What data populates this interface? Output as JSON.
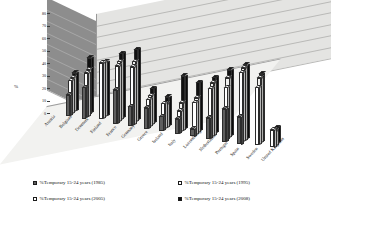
{
  "chart_data": {
    "type": "bar",
    "title": "",
    "xlabel": "",
    "ylabel": "%",
    "ylim": [
      0,
      80
    ],
    "yticks": [
      0,
      10,
      20,
      30,
      40,
      50,
      60,
      70,
      80
    ],
    "grid": true,
    "legend_position": "bottom",
    "categories": [
      "Austria",
      "Belgium",
      "Denmark",
      "Finland",
      "France",
      "Germany",
      "Greece",
      "Ireland",
      "Italy",
      "Luxembourg",
      "Netherlands",
      "Portugal",
      "Spain",
      "Sweden",
      "United Kingdom"
    ],
    "series": [
      {
        "name": "%Temporary 15-24 years (1985)",
        "color": "#5e5e5e",
        "marker": "filled-dark-square",
        "values": [
          0,
          17,
          25,
          0,
          27,
          16,
          17,
          12,
          12,
          6,
          17,
          26,
          22,
          0,
          0
        ]
      },
      {
        "name": "%Temporary 15-24 years (1995)",
        "color": "#ffffff",
        "marker": "hollow-square",
        "values": [
          0,
          27,
          35,
          45,
          45,
          46,
          22,
          21,
          17,
          26,
          39,
          42,
          56,
          46,
          14
        ]
      },
      {
        "name": "%Temporary 15-24  years (2005)",
        "color": "#f0f0ee",
        "marker": "hollow-square",
        "values": [
          0,
          28,
          36,
          44,
          47,
          49,
          24,
          19,
          22,
          28,
          42,
          48,
          58,
          52,
          12
        ]
      },
      {
        "name": "%Temporary 15-24 years (2008)",
        "color": "#111111",
        "marker": "filled-black-square",
        "values": [
          0,
          30,
          44,
          43,
          52,
          57,
          28,
          23,
          42,
          39,
          45,
          53,
          59,
          54,
          13
        ]
      }
    ]
  },
  "axis": {
    "y_title": "%",
    "ticks": [
      "0",
      "10",
      "20",
      "30",
      "40",
      "50",
      "60",
      "70",
      "80"
    ]
  },
  "legend": {
    "items": [
      {
        "label": "%Temporary 15-24 years (1985)",
        "swatch": "#5e5e5e"
      },
      {
        "label": "%Temporary 15-24 years (1995)",
        "swatch": "#ffffff"
      },
      {
        "label": "%Temporary 15-24  years (2005)",
        "swatch": "#ffffff"
      },
      {
        "label": "%Temporary 15-24 years (2008)",
        "swatch": "#111111"
      }
    ]
  }
}
